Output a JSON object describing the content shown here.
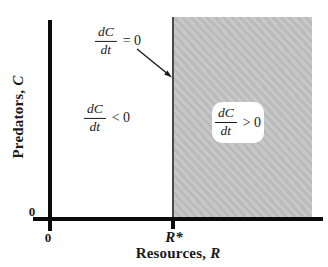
{
  "figure": {
    "axes": {
      "y_label": {
        "text": "Predators,",
        "var": "C"
      },
      "x_label": {
        "text": "Resources,",
        "var": "R"
      },
      "y_zero_tick": "0",
      "x_zero_tick": "0",
      "r_star_tick": "R*"
    },
    "labels": {
      "isocline": {
        "numerator": "dC",
        "denominator": "dt",
        "relation": "= 0"
      },
      "negative_region": {
        "numerator": "dC",
        "denominator": "dt",
        "relation": "< 0"
      },
      "positive_region": {
        "numerator": "dC",
        "denominator": "dt",
        "relation": "> 0"
      }
    },
    "colors": {
      "region_fill": "#c2c2c2",
      "region_edge": "#4a4a4a",
      "axis": "#0a0a0a",
      "callout_fill": "#ffffff",
      "background": "#ffffff"
    }
  }
}
